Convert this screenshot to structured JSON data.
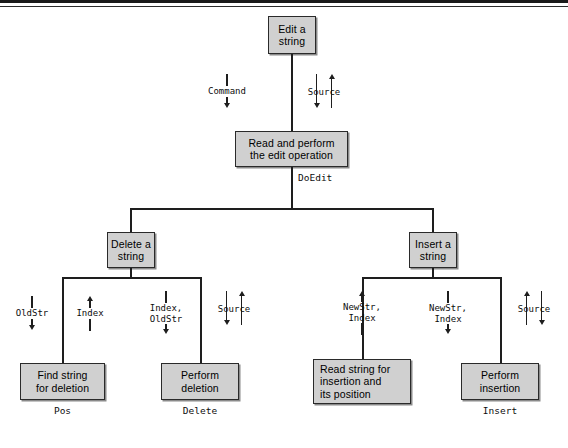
{
  "figure": {
    "type": "structure-chart"
  },
  "modules": {
    "root": {
      "label": "Edit a\nstring"
    },
    "doedit": {
      "label": "Read and perform\nthe edit operation"
    },
    "delete_str": {
      "label": "Delete a\nstring"
    },
    "insert_str": {
      "label": "Insert a\nstring"
    },
    "find_str": {
      "label": "Find string\nfor deletion",
      "caption": "Pos"
    },
    "perf_del": {
      "label": "Perform\ndeletion",
      "caption": "Delete"
    },
    "read_ins": {
      "label": "Read string for\ninsertion and\nits position"
    },
    "perf_ins": {
      "label": "Perform\ninsertion",
      "caption": "Insert"
    }
  },
  "edges": {
    "doedit_name": "DoEdit"
  },
  "couples": {
    "command": {
      "label": "Command",
      "direction": "down"
    },
    "source_root": {
      "label": "Source",
      "direction": "both"
    },
    "oldstr": {
      "label": "OldStr",
      "direction": "down"
    },
    "index_up": {
      "label": "Index",
      "direction": "up"
    },
    "index_oldstr": {
      "label": "Index,\nOldStr",
      "direction": "down"
    },
    "source_del": {
      "label": "Source",
      "direction": "both"
    },
    "newstr_index_up": {
      "label": "NewStr,\nIndex",
      "direction": "up"
    },
    "newstr_index_dn": {
      "label": "NewStr,\nIndex",
      "direction": "down"
    },
    "source_ins": {
      "label": "Source",
      "direction": "both"
    }
  },
  "colors": {
    "box_fill": "#d0d0d0",
    "box_border": "#2a2a2a",
    "stroke": "#1e1e1e",
    "rule": "#1a1a1a",
    "page_bg": "#ffffff"
  }
}
